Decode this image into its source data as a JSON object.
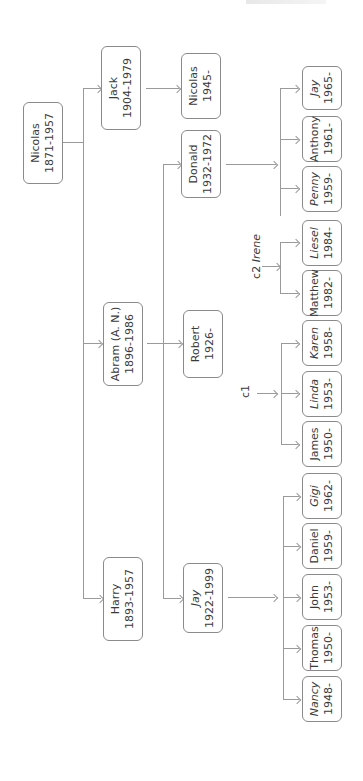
{
  "diagram": {
    "type": "family-tree",
    "orientation": "rotated-90-ccw",
    "root": {
      "name": "Nicolas",
      "years": "1871-1957"
    },
    "generation1": [
      {
        "name": "Harry",
        "years": "1893-1957"
      },
      {
        "name": "Abram (A. N.)",
        "years": "1896-1986"
      },
      {
        "name": "Jack",
        "years": "1904-1979"
      }
    ],
    "generation2": [
      {
        "name": "Jay",
        "years": "1922-1999",
        "parent": "Abram (A. N.)"
      },
      {
        "name": "Robert",
        "years": "1926-",
        "parent": "Abram (A. N.)"
      },
      {
        "name": "Donald",
        "years": "1932-1972",
        "parent": "Abram (A. N.)"
      },
      {
        "name": "Nicolas",
        "years": "1945-",
        "parent": "Jack"
      }
    ],
    "jay_children": [
      {
        "name": "Nancy",
        "years": "1948-",
        "italic": true
      },
      {
        "name": "Thomas",
        "years": "1950-",
        "italic": false
      },
      {
        "name": "John",
        "years": "1953-",
        "italic": false
      },
      {
        "name": "Daniel",
        "years": "1959-",
        "italic": false
      },
      {
        "name": "Gigi",
        "years": "1962-",
        "italic": true
      }
    ],
    "robert_c1_label": "c1",
    "robert_c1_children": [
      {
        "name": "James",
        "years": "1950-",
        "italic": false
      },
      {
        "name": "Linda",
        "years": "1953-",
        "italic": true
      },
      {
        "name": "Karen",
        "years": "1958-",
        "italic": true
      }
    ],
    "robert_c2_label": "c2",
    "robert_c2_spouse": "Irene",
    "robert_c2_children": [
      {
        "name": "Matthew",
        "years": "1982-",
        "italic": false
      },
      {
        "name": "Liesel",
        "years": "1984-",
        "italic": true
      }
    ],
    "donald_children": [
      {
        "name": "Penny",
        "years": "1959-",
        "italic": true
      },
      {
        "name": "Anthony",
        "years": "1961-",
        "italic": false
      },
      {
        "name": "Jay",
        "years": "1965-",
        "italic": true
      }
    ]
  },
  "colors": {
    "line": "#9a9a9a",
    "box_border": "#8a8a8a",
    "text": "#3a3a3a"
  }
}
